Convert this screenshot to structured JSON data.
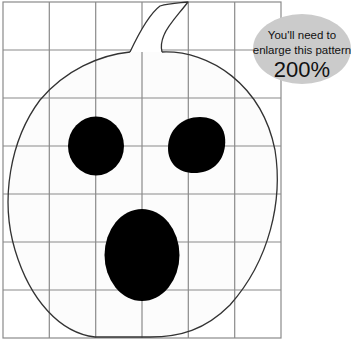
{
  "pattern": {
    "subject": "jack-o-lantern pumpkin pattern",
    "grid": {
      "columns": 6,
      "rows": 7,
      "line_color": "#8a8a8a"
    },
    "outline_color": "#333333",
    "fill_color": "#ffffff",
    "features_color": "#000000"
  },
  "callout": {
    "line1": "You'll need to",
    "line2": "enlarge this pattern",
    "percentage": "200%",
    "background_color": "#cbcbcb"
  }
}
